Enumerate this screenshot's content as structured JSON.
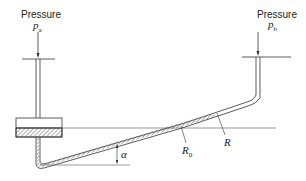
{
  "diagram": {
    "left_port": {
      "label": "Pressure",
      "symbol": "p",
      "subscript": "a"
    },
    "right_port": {
      "label": "Pressure",
      "symbol": "p",
      "subscript": "b"
    },
    "angle_label": "α",
    "reading_initial": {
      "symbol": "R",
      "subscript": "0"
    },
    "reading_final": {
      "symbol": "R"
    },
    "colors": {
      "line": "#333333",
      "hatch": "#888888",
      "background": "#ffffff"
    }
  }
}
